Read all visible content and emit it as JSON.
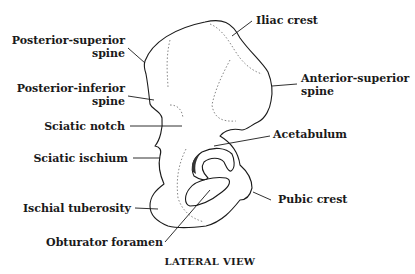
{
  "diagram": {
    "caption": "LATERAL VIEW",
    "labels": {
      "posterior_superior_1": "Posterior-superior",
      "posterior_superior_2": "spine",
      "posterior_inferior_1": "Posterior-inferior",
      "posterior_inferior_2": "spine",
      "sciatic_notch": "Sciatic notch",
      "sciatic_ischium": "Sciatic ischium",
      "ischial_tuberosity": "Ischial tuberosity",
      "obturator_foramen": "Obturator foramen",
      "iliac_crest": "Iliac crest",
      "anterior_superior_1": "Anterior-superior",
      "anterior_superior_2": "spine",
      "acetabulum": "Acetabulum",
      "pubic_crest": "Pubic crest"
    }
  }
}
